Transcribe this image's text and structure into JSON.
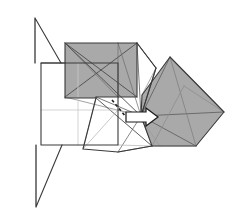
{
  "figure": {
    "type": "origami-crease-pattern",
    "width": 240,
    "height": 224,
    "background_color": "#ffffff"
  },
  "palette": {
    "paper_front": "#ffffff",
    "paper_back_shaded": "#a9a9a9",
    "paper_back_shaded_light": "#b4b4b4",
    "paper_back_shaded_dark": "#9a9a9a",
    "edge_stroke": "#3a3a3a",
    "edge_stroke_dark": "#2b2b2b",
    "crease_light": "#c9c9c9",
    "crease_mid": "#8f8f8f",
    "arrow_fill": "#ffffff",
    "arrow_stroke": "#1a1a1a",
    "dashed_crease": "#1f1f1f"
  },
  "strokes": {
    "outline_width": 1.1,
    "crease_width": 0.7,
    "light_crease_width": 0.7,
    "arrow_width": 1.2,
    "dash_pattern": "3,2.5"
  },
  "shapes": {
    "base_square": {
      "name": "base-square",
      "label": "White base square (front of paper)",
      "points": "41,63 41,145 118,145 118,63",
      "fill": "#ffffff"
    },
    "upper_left_gray_square": {
      "name": "upper-left-shaded-square",
      "label": "Upper-left shaded square flap",
      "points": "65,43 137,43 137,97 96,97 96,98 65,98",
      "fill": "#a9a9a9"
    },
    "right_gray_diamond": {
      "name": "right-shaded-diamond",
      "label": "Right shaded diamond flap",
      "points": "170,57 224,112 196,146 152,146 141,118 142,95",
      "fill": "#a9a9a9"
    },
    "white_wedge": {
      "name": "white-wedge",
      "label": "White wedge between shaded flaps",
      "points": "137,43 156,68 141,116 137,97",
      "fill": "#ffffff"
    },
    "lower_white_polygon": {
      "name": "lower-white-polygon",
      "label": "Lower white polygon region",
      "points": "96,98 140,118 152,146 118,152 83,149",
      "fill": "#ffffff"
    },
    "top_spike": {
      "name": "top-spike",
      "label": "Thin triangular spike pointing up",
      "points": "35,18 35,63 61,63",
      "fill": "#ffffff"
    },
    "bottom_spike": {
      "name": "bottom-spike",
      "label": "Thin triangular spike pointing down",
      "points": "36,207 36,145 62,145",
      "fill": "#ffffff"
    }
  },
  "arrow": {
    "name": "fold-direction-arrow",
    "label": "Fold direction arrow pointing right",
    "direction": "right",
    "tail_x": 126,
    "tip_x": 158,
    "y": 117,
    "fill": "#ffffff",
    "stroke": "#1a1a1a"
  },
  "dashed_crease": {
    "name": "dashed-crease-line",
    "label": "Dashed valley crease",
    "from": "112,100",
    "to": "126,117"
  },
  "creases": {
    "base_square_vertical": "78,63 78,145",
    "base_square_horizontal": "41,110 118,110",
    "notes": "Light gray interior grid creases on the white base square"
  },
  "crease_lines": [
    {
      "name": "crease-ul-diag-1",
      "d": "M65,43 L137,97",
      "color": "#4a4a4a",
      "width": 0.9
    },
    {
      "name": "crease-ul-diag-2",
      "d": "M137,43 L65,97",
      "color": "#4a4a4a",
      "width": 0.9
    },
    {
      "name": "crease-ul-diag-3",
      "d": "M65,43 L118,97",
      "color": "#6a6a6a",
      "width": 0.7
    },
    {
      "name": "crease-ul-diag-4",
      "d": "M65,43 L141,116",
      "color": "#4a4a4a",
      "width": 0.9
    },
    {
      "name": "crease-ul-vert",
      "d": "M118,43 L118,97",
      "color": "#6f6f6f",
      "width": 0.7
    },
    {
      "name": "crease-ul-hub-1",
      "d": "M137,43 L141,116",
      "color": "#5a5a5a",
      "width": 0.8
    },
    {
      "name": "crease-ul-hub-2",
      "d": "M118,43 L141,116",
      "color": "#6a6a6a",
      "width": 0.7
    },
    {
      "name": "crease-ul-hub-3",
      "d": "M96,97 L141,116",
      "color": "#5a5a5a",
      "width": 0.8
    },
    {
      "name": "crease-ul-hub-4",
      "d": "M65,97 L141,116",
      "color": "#7a7a7a",
      "width": 0.7
    },
    {
      "name": "crease-wedge-1",
      "d": "M137,43 L156,68",
      "color": "#4a4a4a",
      "width": 0.9
    },
    {
      "name": "crease-wedge-2",
      "d": "M156,68 L141,116",
      "color": "#4a4a4a",
      "width": 0.9
    },
    {
      "name": "crease-wedge-3",
      "d": "M156,68 L142,95",
      "color": "#8a8a8a",
      "width": 0.7
    },
    {
      "name": "crease-di-1",
      "d": "M141,116 L170,57",
      "color": "#5a5a5a",
      "width": 0.8
    },
    {
      "name": "crease-di-2",
      "d": "M141,116 L224,112",
      "color": "#5a5a5a",
      "width": 0.8
    },
    {
      "name": "crease-di-3",
      "d": "M141,116 L196,146",
      "color": "#5a5a5a",
      "width": 0.8
    },
    {
      "name": "crease-di-4",
      "d": "M170,57 L196,146",
      "color": "#7a7a7a",
      "width": 0.7
    },
    {
      "name": "crease-di-5",
      "d": "M170,57 L224,112",
      "color": "#6a6a6a",
      "width": 0.7
    },
    {
      "name": "crease-di-6",
      "d": "M184,86 L224,112",
      "color": "#8a8a8a",
      "width": 0.7
    },
    {
      "name": "crease-di-7",
      "d": "M152,146 L184,86",
      "color": "#8a8a8a",
      "width": 0.7
    },
    {
      "name": "crease-low-1",
      "d": "M96,98 L152,146",
      "color": "#4a4a4a",
      "width": 0.9
    },
    {
      "name": "crease-low-2",
      "d": "M141,116 L118,152",
      "color": "#6a6a6a",
      "width": 0.8
    },
    {
      "name": "crease-low-3",
      "d": "M83,149 L118,110",
      "color": "#b0b0b0",
      "width": 0.7
    },
    {
      "name": "crease-low-4",
      "d": "M118,145 L152,146",
      "color": "#b0b0b0",
      "width": 0.7
    },
    {
      "name": "crease-low-5",
      "d": "M152,146 L196,146",
      "color": "#b0b0b0",
      "width": 0.7
    },
    {
      "name": "crease-low-6",
      "d": "M118,110 L141,116",
      "color": "#b0b0b0",
      "width": 0.7
    },
    {
      "name": "crease-low-7",
      "d": "M96,98 L83,149",
      "color": "#9a9a9a",
      "width": 0.7
    },
    {
      "name": "crease-low-8",
      "d": "M140,118 L160,146",
      "color": "#9a9a9a",
      "width": 0.7
    },
    {
      "name": "crease-low-9",
      "d": "M118,152 L152,146",
      "color": "#6a6a6a",
      "width": 0.8
    },
    {
      "name": "crease-base-v",
      "d": "M78,63 L78,145",
      "color": "#c9c9c9",
      "width": 0.8
    },
    {
      "name": "crease-base-h",
      "d": "M41,110 L118,110",
      "color": "#c9c9c9",
      "width": 0.8
    },
    {
      "name": "crease-spike-top",
      "d": "M35,18 L35,63",
      "color": "#8a8a8a",
      "width": 0.8
    },
    {
      "name": "crease-spike-bot",
      "d": "M36,207 L36,145",
      "color": "#8a8a8a",
      "width": 0.8
    }
  ],
  "outlines": [
    {
      "name": "outline-base-square",
      "d": "M41,63 L41,145 L118,145 L118,63 Z"
    },
    {
      "name": "outline-ul-square",
      "d": "M65,43 L137,43 L137,97 L96,97 L96,98 L65,98 Z"
    },
    {
      "name": "outline-diamond",
      "d": "M170,57 L224,112 L196,146 L152,146 L141,116 L142,95 Z"
    },
    {
      "name": "outline-wedge",
      "d": "M137,43 L156,68 L141,116"
    },
    {
      "name": "outline-top-spike",
      "d": "M35,18 L35,63 M35,18 L61,63"
    },
    {
      "name": "outline-bot-spike",
      "d": "M36,207 L36,145 M36,207 L62,145"
    },
    {
      "name": "outline-lower-poly",
      "d": "M96,98 L83,149 L118,152 L152,146"
    },
    {
      "name": "outline-left-edge",
      "d": "M41,63 L65,63"
    }
  ]
}
